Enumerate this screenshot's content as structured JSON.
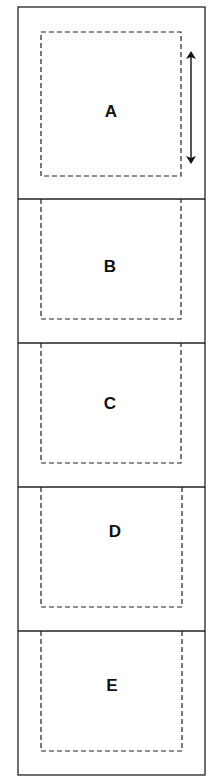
{
  "diagram": {
    "panels": [
      {
        "id": "A",
        "label": "A",
        "has_arrow": true
      },
      {
        "id": "B",
        "label": "B",
        "has_arrow": false
      },
      {
        "id": "C",
        "label": "C",
        "has_arrow": false
      },
      {
        "id": "D",
        "label": "D",
        "has_arrow": false
      },
      {
        "id": "E",
        "label": "E",
        "has_arrow": false
      }
    ],
    "arrow": {
      "type": "double-headed-vertical",
      "panel": "A"
    },
    "colors": {
      "line": "#222222",
      "background": "#ffffff"
    }
  }
}
